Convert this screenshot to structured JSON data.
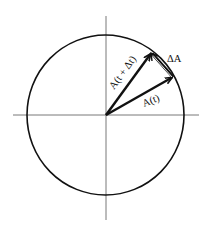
{
  "diagram": {
    "colors": {
      "background": "#ffffff",
      "ink": "#111111",
      "axis": "#555555"
    },
    "circle": {
      "cx": 105.5,
      "cy": 115,
      "r": 79
    },
    "axes": {
      "horizontal": {
        "x1": 13,
        "y1": 115,
        "x2": 199,
        "y2": 115
      },
      "vertical": {
        "x1": 106,
        "y1": 16,
        "x2": 106,
        "y2": 220
      }
    },
    "vectors": [
      {
        "id": "A_t",
        "label": "A(t)",
        "from": [
          106,
          115
        ],
        "to": [
          173,
          77
        ]
      },
      {
        "id": "A_t_dt",
        "label": "A(t + Δt)",
        "from": [
          106,
          115
        ],
        "to": [
          151,
          53
        ]
      },
      {
        "id": "delta_A",
        "label": "ΔA",
        "from": [
          173,
          77
        ],
        "to": [
          151,
          53
        ]
      }
    ],
    "labels": {
      "a_t": "A(t)",
      "a_t_dt": "A(t + Δt)",
      "delta_a": "ΔA"
    }
  }
}
